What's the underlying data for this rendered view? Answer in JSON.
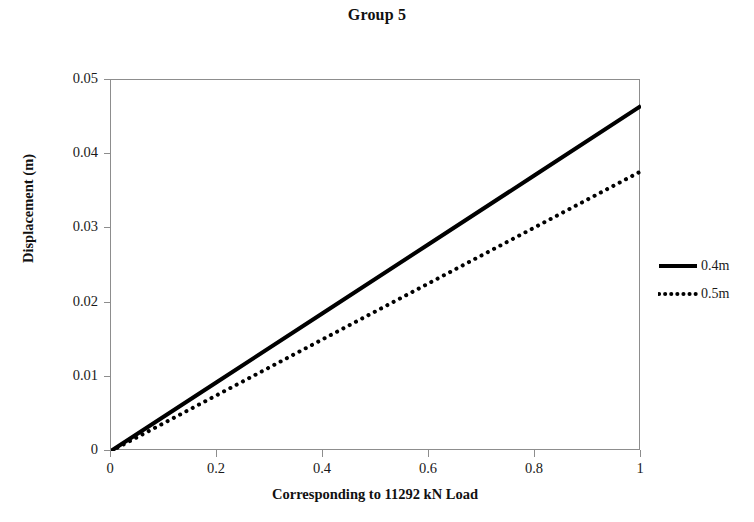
{
  "chart_data": {
    "type": "line",
    "title": "Group 5",
    "xlabel": "Corresponding to 11292 kN Load",
    "ylabel": "Displacement (m)",
    "xlim": [
      0,
      1
    ],
    "ylim": [
      0,
      0.05
    ],
    "grid": false,
    "legend_position": "right",
    "x_ticks": [
      "0",
      "0.2",
      "0.4",
      "0.6",
      "0.8",
      "1"
    ],
    "x_tick_values": [
      0,
      0.2,
      0.4,
      0.6,
      0.8,
      1
    ],
    "y_ticks": [
      "0",
      "0.01",
      "0.02",
      "0.03",
      "0.04",
      "0.05"
    ],
    "y_tick_values": [
      0,
      0.01,
      0.02,
      0.03,
      0.04,
      0.05
    ],
    "x": [
      0,
      0.2,
      0.4,
      0.6,
      0.8,
      1
    ],
    "series": [
      {
        "name": "0.4m",
        "style": "solid",
        "color": "#000000",
        "width": 4,
        "values": [
          0,
          0.0093,
          0.0186,
          0.0279,
          0.0372,
          0.0465
        ]
      },
      {
        "name": "0.5m",
        "style": "dotted",
        "color": "#000000",
        "width": 4,
        "values": [
          0,
          0.00754,
          0.01508,
          0.02262,
          0.03016,
          0.0377
        ]
      }
    ]
  },
  "legend": {
    "items": [
      {
        "label": "0.4m"
      },
      {
        "label": "0.5m"
      }
    ]
  },
  "colors": {
    "axis": "#8d8d8d",
    "text": "#1a1a1a",
    "series": "#000000",
    "background": "#ffffff"
  }
}
